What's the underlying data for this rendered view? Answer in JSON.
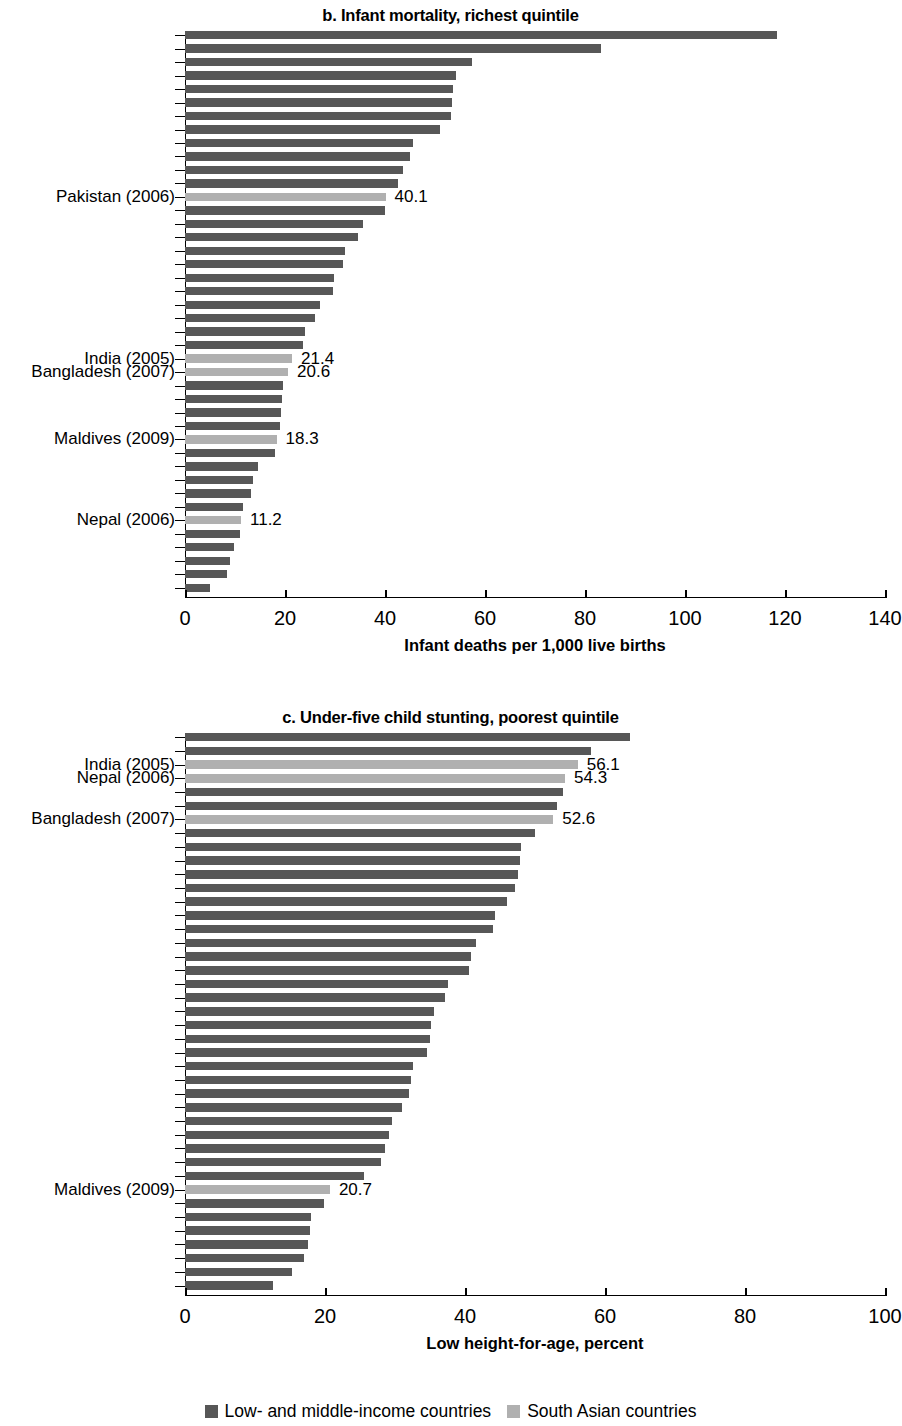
{
  "colors": {
    "lmic": "#575757",
    "south_asian": "#b0b0b0"
  },
  "legend": {
    "items": [
      {
        "label": "Low- and middle-income countries",
        "key": "lmic"
      },
      {
        "label": "South Asian countries",
        "key": "south_asian"
      }
    ]
  },
  "panel_b": {
    "title": "b. Infant mortality, richest quintile",
    "axis_title": "Infant deaths per 1,000 live births",
    "ticks": [
      "0",
      "20",
      "40",
      "60",
      "80",
      "100",
      "120",
      "140"
    ]
  },
  "panel_c": {
    "title": "c. Under-five child stunting, poorest quintile",
    "axis_title": "Low height-for-age, percent",
    "ticks": [
      "0",
      "20",
      "40",
      "60",
      "80",
      "100"
    ]
  },
  "chart_data": [
    {
      "type": "bar",
      "orientation": "horizontal",
      "title": "b. Infant mortality, richest quintile",
      "xlabel": "Infant deaths per 1,000 live births",
      "ylabel": "",
      "xlim": [
        0,
        140
      ],
      "xticks": [
        0,
        20,
        40,
        60,
        80,
        100,
        120,
        140
      ],
      "grid": false,
      "legend": [
        "Low- and middle-income countries",
        "South Asian countries"
      ],
      "legend_position": "bottom",
      "bars": [
        {
          "label": "",
          "value": 118.4,
          "group": "lmic",
          "annotation": ""
        },
        {
          "label": "",
          "value": 83.1,
          "group": "lmic",
          "annotation": ""
        },
        {
          "label": "",
          "value": 57.3,
          "group": "lmic",
          "annotation": ""
        },
        {
          "label": "",
          "value": 54.2,
          "group": "lmic",
          "annotation": ""
        },
        {
          "label": "",
          "value": 53.6,
          "group": "lmic",
          "annotation": ""
        },
        {
          "label": "",
          "value": 53.4,
          "group": "lmic",
          "annotation": ""
        },
        {
          "label": "",
          "value": 53.2,
          "group": "lmic",
          "annotation": ""
        },
        {
          "label": "",
          "value": 51.0,
          "group": "lmic",
          "annotation": ""
        },
        {
          "label": "",
          "value": 45.5,
          "group": "lmic",
          "annotation": ""
        },
        {
          "label": "",
          "value": 45.0,
          "group": "lmic",
          "annotation": ""
        },
        {
          "label": "",
          "value": 43.5,
          "group": "lmic",
          "annotation": ""
        },
        {
          "label": "",
          "value": 42.5,
          "group": "lmic",
          "annotation": ""
        },
        {
          "label": "Pakistan (2006)",
          "value": 40.1,
          "group": "south_asian",
          "annotation": "40.1"
        },
        {
          "label": "",
          "value": 40.0,
          "group": "lmic",
          "annotation": ""
        },
        {
          "label": "",
          "value": 35.5,
          "group": "lmic",
          "annotation": ""
        },
        {
          "label": "",
          "value": 34.5,
          "group": "lmic",
          "annotation": ""
        },
        {
          "label": "",
          "value": 32.0,
          "group": "lmic",
          "annotation": ""
        },
        {
          "label": "",
          "value": 31.5,
          "group": "lmic",
          "annotation": ""
        },
        {
          "label": "",
          "value": 29.8,
          "group": "lmic",
          "annotation": ""
        },
        {
          "label": "",
          "value": 29.5,
          "group": "lmic",
          "annotation": ""
        },
        {
          "label": "",
          "value": 27.0,
          "group": "lmic",
          "annotation": ""
        },
        {
          "label": "",
          "value": 26.0,
          "group": "lmic",
          "annotation": ""
        },
        {
          "label": "",
          "value": 24.0,
          "group": "lmic",
          "annotation": ""
        },
        {
          "label": "",
          "value": 23.6,
          "group": "lmic",
          "annotation": ""
        },
        {
          "label": "India (2005)",
          "value": 21.4,
          "group": "south_asian",
          "annotation": "21.4"
        },
        {
          "label": "Bangladesh (2007)",
          "value": 20.6,
          "group": "south_asian",
          "annotation": "20.6"
        },
        {
          "label": "",
          "value": 19.5,
          "group": "lmic",
          "annotation": ""
        },
        {
          "label": "",
          "value": 19.4,
          "group": "lmic",
          "annotation": ""
        },
        {
          "label": "",
          "value": 19.2,
          "group": "lmic",
          "annotation": ""
        },
        {
          "label": "",
          "value": 19.0,
          "group": "lmic",
          "annotation": ""
        },
        {
          "label": "Maldives (2009)",
          "value": 18.3,
          "group": "south_asian",
          "annotation": "18.3"
        },
        {
          "label": "",
          "value": 18.0,
          "group": "lmic",
          "annotation": ""
        },
        {
          "label": "",
          "value": 14.5,
          "group": "lmic",
          "annotation": ""
        },
        {
          "label": "",
          "value": 13.5,
          "group": "lmic",
          "annotation": ""
        },
        {
          "label": "",
          "value": 13.2,
          "group": "lmic",
          "annotation": ""
        },
        {
          "label": "",
          "value": 11.5,
          "group": "lmic",
          "annotation": ""
        },
        {
          "label": "Nepal (2006)",
          "value": 11.2,
          "group": "south_asian",
          "annotation": "11.2"
        },
        {
          "label": "",
          "value": 11.0,
          "group": "lmic",
          "annotation": ""
        },
        {
          "label": "",
          "value": 9.8,
          "group": "lmic",
          "annotation": ""
        },
        {
          "label": "",
          "value": 9.0,
          "group": "lmic",
          "annotation": ""
        },
        {
          "label": "",
          "value": 8.4,
          "group": "lmic",
          "annotation": ""
        },
        {
          "label": "",
          "value": 5.0,
          "group": "lmic",
          "annotation": ""
        }
      ]
    },
    {
      "type": "bar",
      "orientation": "horizontal",
      "title": "c. Under-five child stunting, poorest quintile",
      "xlabel": "Low height-for-age, percent",
      "ylabel": "",
      "xlim": [
        0,
        100
      ],
      "xticks": [
        0,
        20,
        40,
        60,
        80,
        100
      ],
      "grid": false,
      "legend": [
        "Low- and middle-income countries",
        "South Asian countries"
      ],
      "legend_position": "bottom",
      "bars": [
        {
          "label": "",
          "value": 63.5,
          "group": "lmic",
          "annotation": ""
        },
        {
          "label": "",
          "value": 58.0,
          "group": "lmic",
          "annotation": ""
        },
        {
          "label": "India (2005)",
          "value": 56.1,
          "group": "south_asian",
          "annotation": "56.1"
        },
        {
          "label": "Nepal (2006)",
          "value": 54.3,
          "group": "south_asian",
          "annotation": "54.3"
        },
        {
          "label": "",
          "value": 54.0,
          "group": "lmic",
          "annotation": ""
        },
        {
          "label": "",
          "value": 53.2,
          "group": "lmic",
          "annotation": ""
        },
        {
          "label": "Bangladesh (2007)",
          "value": 52.6,
          "group": "south_asian",
          "annotation": "52.6"
        },
        {
          "label": "",
          "value": 50.0,
          "group": "lmic",
          "annotation": ""
        },
        {
          "label": "",
          "value": 48.0,
          "group": "lmic",
          "annotation": ""
        },
        {
          "label": "",
          "value": 47.8,
          "group": "lmic",
          "annotation": ""
        },
        {
          "label": "",
          "value": 47.5,
          "group": "lmic",
          "annotation": ""
        },
        {
          "label": "",
          "value": 47.2,
          "group": "lmic",
          "annotation": ""
        },
        {
          "label": "",
          "value": 46.0,
          "group": "lmic",
          "annotation": ""
        },
        {
          "label": "",
          "value": 44.3,
          "group": "lmic",
          "annotation": ""
        },
        {
          "label": "",
          "value": 44.0,
          "group": "lmic",
          "annotation": ""
        },
        {
          "label": "",
          "value": 41.5,
          "group": "lmic",
          "annotation": ""
        },
        {
          "label": "",
          "value": 40.8,
          "group": "lmic",
          "annotation": ""
        },
        {
          "label": "",
          "value": 40.5,
          "group": "lmic",
          "annotation": ""
        },
        {
          "label": "",
          "value": 37.5,
          "group": "lmic",
          "annotation": ""
        },
        {
          "label": "",
          "value": 37.2,
          "group": "lmic",
          "annotation": ""
        },
        {
          "label": "",
          "value": 35.5,
          "group": "lmic",
          "annotation": ""
        },
        {
          "label": "",
          "value": 35.2,
          "group": "lmic",
          "annotation": ""
        },
        {
          "label": "",
          "value": 35.0,
          "group": "lmic",
          "annotation": ""
        },
        {
          "label": "",
          "value": 34.6,
          "group": "lmic",
          "annotation": ""
        },
        {
          "label": "",
          "value": 32.5,
          "group": "lmic",
          "annotation": ""
        },
        {
          "label": "",
          "value": 32.3,
          "group": "lmic",
          "annotation": ""
        },
        {
          "label": "",
          "value": 32.0,
          "group": "lmic",
          "annotation": ""
        },
        {
          "label": "",
          "value": 31.0,
          "group": "lmic",
          "annotation": ""
        },
        {
          "label": "",
          "value": 29.5,
          "group": "lmic",
          "annotation": ""
        },
        {
          "label": "",
          "value": 29.2,
          "group": "lmic",
          "annotation": ""
        },
        {
          "label": "",
          "value": 28.5,
          "group": "lmic",
          "annotation": ""
        },
        {
          "label": "",
          "value": 28.0,
          "group": "lmic",
          "annotation": ""
        },
        {
          "label": "",
          "value": 25.5,
          "group": "lmic",
          "annotation": ""
        },
        {
          "label": "Maldives (2009)",
          "value": 20.7,
          "group": "south_asian",
          "annotation": "20.7"
        },
        {
          "label": "",
          "value": 19.8,
          "group": "lmic",
          "annotation": ""
        },
        {
          "label": "",
          "value": 18.0,
          "group": "lmic",
          "annotation": ""
        },
        {
          "label": "",
          "value": 17.8,
          "group": "lmic",
          "annotation": ""
        },
        {
          "label": "",
          "value": 17.5,
          "group": "lmic",
          "annotation": ""
        },
        {
          "label": "",
          "value": 17.0,
          "group": "lmic",
          "annotation": ""
        },
        {
          "label": "",
          "value": 15.3,
          "group": "lmic",
          "annotation": ""
        },
        {
          "label": "",
          "value": 12.5,
          "group": "lmic",
          "annotation": ""
        }
      ]
    }
  ]
}
